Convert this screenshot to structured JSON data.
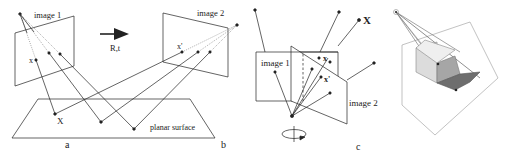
{
  "figure": {
    "panel_a": {
      "label": "a",
      "image1_label": "image 1",
      "point_x_label": "x",
      "world_point_label": "X",
      "surface_label": "planar surface"
    },
    "motion": {
      "label": "R,t"
    },
    "panel_b": {
      "label": "b",
      "image2_label": "image 2",
      "point_xprime_label": "x'"
    },
    "panel_c": {
      "label": "c",
      "image1_label": "image 1",
      "image2_label": "image 2",
      "world_point_label": "X",
      "point_x_label": "x",
      "point_xprime_label": "x'"
    },
    "panel_d": {
      "label": ""
    },
    "colors": {
      "line": "#222222",
      "light_line": "#9a9a9a",
      "shade_dark": "#6e6e6e",
      "shade_mid": "#a8a8a8",
      "shade_light": "#d8d8d8"
    }
  }
}
